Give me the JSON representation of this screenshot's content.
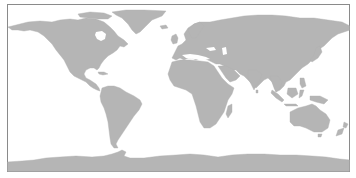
{
  "map": {
    "projection": "equirectangular",
    "colors": {
      "land": "#b5b5b5",
      "ocean": "#ffffff",
      "border": "#8a8a8a"
    },
    "regions": [
      "north-america",
      "greenland",
      "south-america",
      "europe",
      "africa",
      "asia",
      "australia",
      "antarctica"
    ]
  }
}
